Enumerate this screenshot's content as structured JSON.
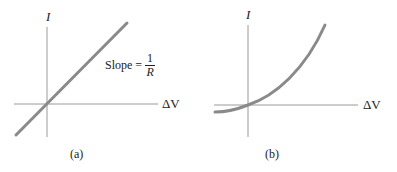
{
  "panels": [
    {
      "id": "a",
      "caption": "(a)",
      "y_axis_label": "I",
      "x_axis_label": "ΔV",
      "annotation": {
        "prefix": "Slope = ",
        "numerator": "1",
        "denominator": "R"
      },
      "curve": "linear",
      "curve_color": "#8a8a8a"
    },
    {
      "id": "b",
      "caption": "(b)",
      "y_axis_label": "I",
      "x_axis_label": "ΔV",
      "curve": "nonlinear",
      "curve_color": "#8a8a8a"
    }
  ],
  "colors": {
    "axis": "#9a9a9a",
    "curve": "#8a8a8a",
    "text": "#222222"
  }
}
